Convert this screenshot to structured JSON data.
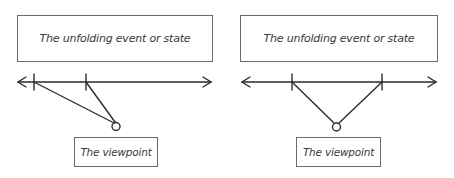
{
  "diagrams": [
    {
      "id": "left",
      "event_label": "The unfolding event or state",
      "viewpoint_label": "The viewpoint"
    },
    {
      "id": "right",
      "event_label": "The unfolding event or state",
      "viewpoint_label": "The viewpoint"
    }
  ],
  "colors": {
    "line": "#2b2b2b",
    "box_border": "#6b6b6b",
    "text": "#3a3a3a"
  }
}
